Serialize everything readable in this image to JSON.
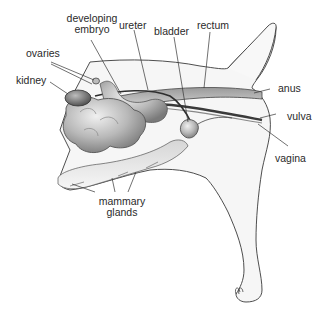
{
  "diagram": {
    "colors": {
      "body_fill": "#f4f4f4",
      "outline": "#3a3a3a",
      "organ_fill": "#bdbdbd",
      "organ_dark": "#6e6e6e",
      "leader_line": "#333333",
      "text": "#2a2a2a"
    },
    "labels": {
      "developing_embryo_line1": "developing",
      "developing_embryo_line2": "embryo",
      "ureter": "ureter",
      "bladder": "bladder",
      "rectum": "rectum",
      "ovaries": "ovaries",
      "kidney": "kidney",
      "anus": "anus",
      "vulva": "vulva",
      "vagina": "vagina",
      "mammary_glands_line1": "mammary",
      "mammary_glands_line2": "glands"
    }
  }
}
